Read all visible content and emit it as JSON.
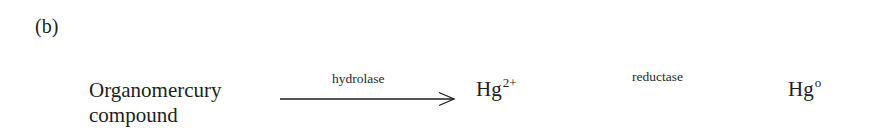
{
  "figure": {
    "panel_label": "(b)",
    "reactant": {
      "line1": "Organomercury",
      "line2": "compound"
    },
    "step1": {
      "enzyme": "hydrolase",
      "arrow": "right-arrow"
    },
    "intermediate": {
      "symbol": "Hg",
      "superscript": "2+"
    },
    "step2": {
      "enzyme": "reductase"
    },
    "product": {
      "symbol": "Hg",
      "superscript": "o"
    }
  }
}
